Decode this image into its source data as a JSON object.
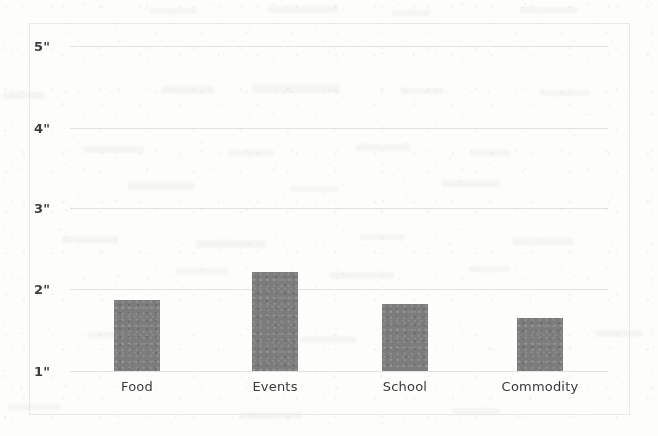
{
  "chart_data": {
    "type": "bar",
    "title": "",
    "subtitle": "",
    "xlabel": "",
    "ylabel": "",
    "categories": [
      "Food",
      "Events",
      "School",
      "Commodity"
    ],
    "values": [
      1.87,
      2.22,
      1.82,
      1.65
    ],
    "ylim": [
      1,
      5
    ],
    "ytick_labels": [
      "5\"",
      "4\"",
      "3\"",
      "2\"",
      "1\""
    ],
    "ytick_values": [
      5,
      4,
      3,
      2,
      1
    ],
    "unit": "inches",
    "grid": true,
    "legend": false,
    "bar_color": "#7c7c7c",
    "grid_color": "#e2e2e0",
    "frame_color": "#e9e9e7",
    "background_color": "#fdfdfc",
    "series": [
      {
        "name": "",
        "values": [
          1.87,
          2.22,
          1.82,
          1.65
        ]
      }
    ]
  },
  "axis": {
    "y": {
      "ticks": [
        {
          "label": "5\"",
          "value": 5
        },
        {
          "label": "4\"",
          "value": 4
        },
        {
          "label": "3\"",
          "value": 3
        },
        {
          "label": "2\"",
          "value": 2
        },
        {
          "label": "1\"",
          "value": 1
        }
      ]
    },
    "x": {
      "ticks": [
        {
          "label": "Food"
        },
        {
          "label": "Events"
        },
        {
          "label": "School"
        },
        {
          "label": "Commodity"
        }
      ]
    }
  }
}
